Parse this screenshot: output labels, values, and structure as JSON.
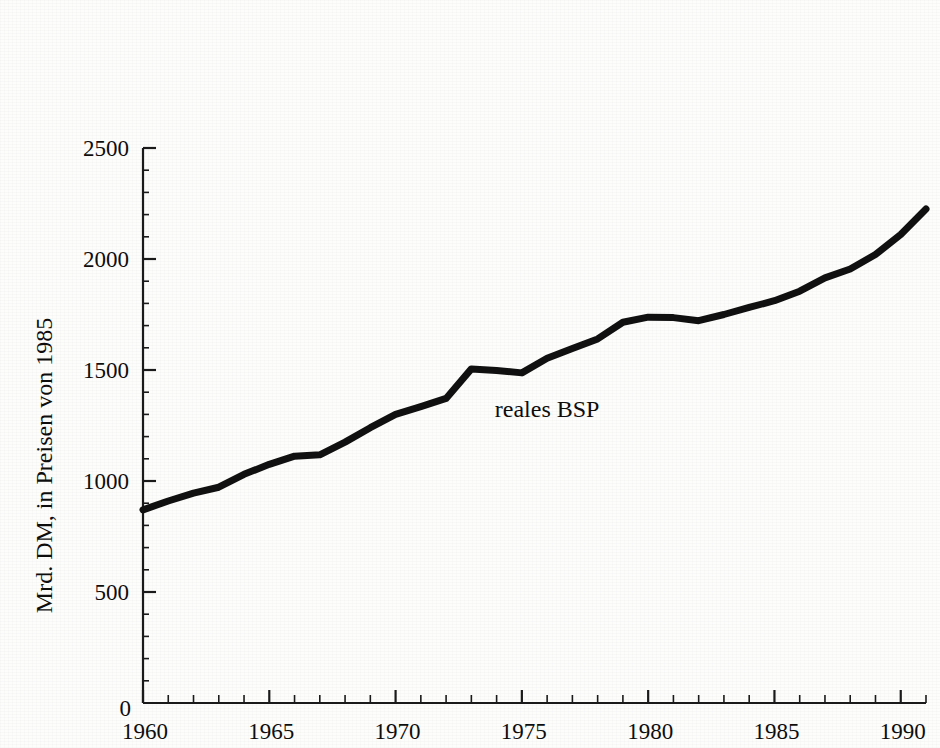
{
  "chart_data": {
    "type": "line",
    "title": "",
    "xlabel": "",
    "ylabel": "Mrd. DM, in Preisen von 1985",
    "origin_label": "0",
    "xlim": [
      1960,
      1991
    ],
    "ylim": [
      0,
      2500
    ],
    "grid": false,
    "legend": "inline-annotation",
    "y_ticks": [
      0,
      500,
      1000,
      1500,
      2000,
      2500
    ],
    "y_tick_labels": [
      "0",
      "500",
      "1000",
      "1500",
      "2000",
      "2500"
    ],
    "y_minor_tick_step": 100,
    "x_ticks": [
      1960,
      1965,
      1970,
      1975,
      1980,
      1985,
      1990
    ],
    "x_tick_labels": [
      "1960",
      "1965",
      "1970",
      "1975",
      "1980",
      "1985",
      "1990"
    ],
    "x_minor_tick_step": 1,
    "series": [
      {
        "name": "reales BSP",
        "annotation": "reales BSP",
        "annotation_x": 1976.0,
        "annotation_y": 1290,
        "color": "#101010",
        "line_width": 7,
        "x": [
          1960,
          1961,
          1962,
          1963,
          1964,
          1965,
          1966,
          1967,
          1968,
          1969,
          1970,
          1971,
          1972,
          1973,
          1974,
          1975,
          1976,
          1977,
          1978,
          1979,
          1980,
          1981,
          1982,
          1983,
          1984,
          1985,
          1986,
          1987,
          1988,
          1989,
          1990,
          1991
        ],
        "values": [
          870,
          910,
          945,
          972,
          1030,
          1075,
          1112,
          1118,
          1175,
          1240,
          1300,
          1335,
          1372,
          1505,
          1498,
          1487,
          1553,
          1597,
          1640,
          1715,
          1738,
          1736,
          1722,
          1750,
          1782,
          1812,
          1855,
          1915,
          1955,
          2020,
          2110,
          2225
        ]
      }
    ]
  },
  "axis": {
    "y_title": "Mrd. DM, in Preisen von 1985",
    "origin": "0"
  }
}
